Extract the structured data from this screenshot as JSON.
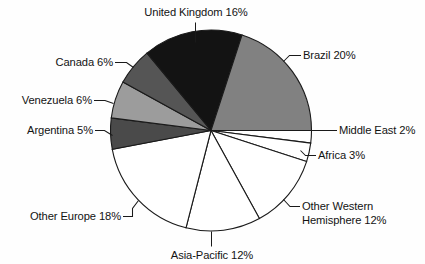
{
  "chart_data": {
    "type": "pie",
    "title": "",
    "subtitle": "",
    "xlabel": "",
    "ylabel": "",
    "legend_position": "none",
    "grid": false,
    "units": "percent",
    "total": 100,
    "start_angle_deg": 0,
    "direction": "clockwise",
    "categories": [
      "Middle East",
      "Africa",
      "Other Western Hemisphere",
      "Asia-Pacific",
      "Other Europe",
      "Argentina",
      "Venezuela",
      "Canada",
      "United Kingdom",
      "Brazil"
    ],
    "values": [
      2,
      3,
      12,
      12,
      18,
      5,
      6,
      6,
      16,
      20
    ],
    "slice_colors": [
      "#ffffff",
      "#ffffff",
      "#ffffff",
      "#ffffff",
      "#ffffff",
      "#4a4a4a",
      "#9c9c9c",
      "#555555",
      "#131313",
      "#818181"
    ],
    "slices": [
      {
        "label": "Middle East",
        "value": 2,
        "color": "#ffffff"
      },
      {
        "label": "Africa",
        "value": 3,
        "color": "#ffffff"
      },
      {
        "label": "Other Western Hemisphere",
        "value": 12,
        "color": "#ffffff"
      },
      {
        "label": "Asia-Pacific",
        "value": 12,
        "color": "#ffffff"
      },
      {
        "label": "Other Europe",
        "value": 18,
        "color": "#ffffff"
      },
      {
        "label": "Argentina",
        "value": 5,
        "color": "#4a4a4a"
      },
      {
        "label": "Venezuela",
        "value": 6,
        "color": "#9c9c9c"
      },
      {
        "label": "Canada",
        "value": 6,
        "color": "#555555"
      },
      {
        "label": "United Kingdom",
        "value": 16,
        "color": "#131313"
      },
      {
        "label": "Brazil",
        "value": 20,
        "color": "#818181"
      }
    ]
  },
  "labels": {
    "united_kingdom": "United Kingdom 16%",
    "brazil": "Brazil 20%",
    "middle_east": "Middle East 2%",
    "africa": "Africa 3%",
    "other_western_hemisphere_line1": "Other Western",
    "other_western_hemisphere_line2": "Hemisphere 12%",
    "asia_pacific": "Asia-Pacific 12%",
    "other_europe": "Other Europe 18%",
    "argentina": "Argentina 5%",
    "venezuela": "Venezuela 6%",
    "canada": "Canada 6%"
  }
}
